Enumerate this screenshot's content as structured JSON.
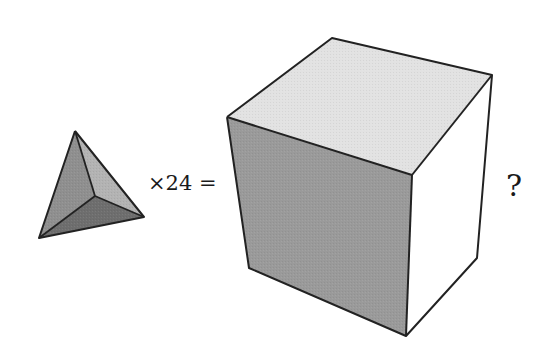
{
  "figure": {
    "equation_label": "×24 =",
    "question_mark": "?",
    "tetrahedron": {
      "vertices": {
        "apex": [
          75,
          131
        ],
        "bottom_left": [
          39,
          238
        ],
        "right": [
          144,
          217
        ],
        "inner": [
          95,
          196
        ]
      },
      "face_colors": {
        "left_face": "#8f8f8f",
        "right_face": "#b3b3b3",
        "bottom_face": "#6e6e6e"
      }
    },
    "cube": {
      "vertices": {
        "top_back": [
          332,
          38
        ],
        "top_right": [
          492,
          75
        ],
        "top_left": [
          227,
          117
        ],
        "top_front": [
          412,
          175
        ],
        "bottom_left": [
          249,
          268
        ],
        "bottom_front": [
          406,
          336
        ],
        "bottom_right": [
          477,
          258
        ]
      },
      "face_colors": {
        "top_face": "#e2e2e2",
        "front_face": "#9a9a9a",
        "right_face": "#ffffff"
      }
    },
    "edge_color": "#222222"
  }
}
